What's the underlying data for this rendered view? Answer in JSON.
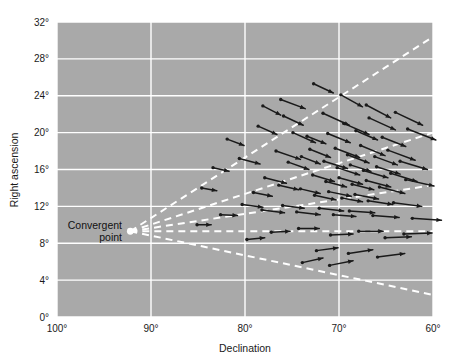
{
  "chart_data": {
    "type": "scatter",
    "title": "",
    "subtitle": "",
    "xlabel": "Declination",
    "ylabel": "Right ascension",
    "xlim": [
      100,
      60
    ],
    "ylim": [
      0,
      32
    ],
    "x_ticks": [
      100,
      90,
      80,
      70,
      60
    ],
    "x_tick_labels": [
      "100°",
      "90°",
      "80°",
      "70°",
      "60°"
    ],
    "y_ticks": [
      0,
      4,
      8,
      12,
      16,
      20,
      24,
      28,
      32
    ],
    "y_tick_labels": [
      "0°",
      "4°",
      "8°",
      "12°",
      "16°",
      "20°",
      "24°",
      "28°",
      "32°"
    ],
    "grid": true,
    "grid_color": "#ffffff",
    "plot_background": "#a9a9a9",
    "page_background": "#ffffff",
    "marker_color": "#1a1a1a",
    "ray_color": "#ffffff",
    "ray_style": "dashed",
    "annotations": [
      {
        "name": "convergent-point",
        "label_line1": "Convergent",
        "label_line2": "point",
        "x": 92.2,
        "y": 9.3,
        "marker": "dot",
        "marker_color": "#ffffff"
      }
    ],
    "rays": [
      {
        "name": "ray-upper-1",
        "from_x": 92.2,
        "from_y": 9.3,
        "to_x": 60.0,
        "to_y": 30.4
      },
      {
        "name": "ray-upper-2",
        "from_x": 92.2,
        "from_y": 9.3,
        "to_x": 60.0,
        "to_y": 20.0
      },
      {
        "name": "ray-middle",
        "from_x": 92.2,
        "from_y": 9.3,
        "to_x": 60.0,
        "to_y": 14.3
      },
      {
        "name": "ray-horizontal",
        "from_x": 92.2,
        "from_y": 9.3,
        "to_x": 60.0,
        "to_y": 9.3
      },
      {
        "name": "ray-lower",
        "from_x": 92.2,
        "from_y": 9.3,
        "to_x": 60.0,
        "to_y": 2.4
      }
    ],
    "series": [
      {
        "name": "proper motion vectors",
        "description": "Each point is a cluster star; the attached arrow is its proper-motion vector pointing back toward the convergent point.",
        "points": [
          {
            "x": 76.2,
            "y": 23.6,
            "dx": 2.6,
            "dy": 1.0
          },
          {
            "x": 72.7,
            "y": 25.3,
            "dx": 2.1,
            "dy": 1.0
          },
          {
            "x": 78.6,
            "y": 20.7,
            "dx": 2.0,
            "dy": 0.9
          },
          {
            "x": 71.7,
            "y": 22.1,
            "dx": 2.8,
            "dy": 1.3
          },
          {
            "x": 80.6,
            "y": 17.2,
            "dx": 2.2,
            "dy": 0.6
          },
          {
            "x": 76.7,
            "y": 18.0,
            "dx": 2.6,
            "dy": 0.9
          },
          {
            "x": 74.9,
            "y": 20.0,
            "dx": 2.4,
            "dy": 1.1
          },
          {
            "x": 73.4,
            "y": 19.6,
            "dx": 2.0,
            "dy": 0.8
          },
          {
            "x": 71.2,
            "y": 19.9,
            "dx": 2.4,
            "dy": 1.0
          },
          {
            "x": 69.5,
            "y": 21.0,
            "dx": 2.7,
            "dy": 1.2
          },
          {
            "x": 68.2,
            "y": 20.2,
            "dx": 2.3,
            "dy": 1.0
          },
          {
            "x": 66.8,
            "y": 21.6,
            "dx": 2.8,
            "dy": 1.3
          },
          {
            "x": 65.4,
            "y": 19.5,
            "dx": 2.5,
            "dy": 1.0
          },
          {
            "x": 70.4,
            "y": 18.3,
            "dx": 2.6,
            "dy": 1.0
          },
          {
            "x": 69.1,
            "y": 17.6,
            "dx": 2.3,
            "dy": 0.9
          },
          {
            "x": 67.7,
            "y": 18.6,
            "dx": 2.6,
            "dy": 1.1
          },
          {
            "x": 66.2,
            "y": 17.4,
            "dx": 2.4,
            "dy": 0.9
          },
          {
            "x": 64.8,
            "y": 18.1,
            "dx": 2.9,
            "dy": 1.1
          },
          {
            "x": 71.6,
            "y": 16.9,
            "dx": 2.5,
            "dy": 0.8
          },
          {
            "x": 70.2,
            "y": 16.2,
            "dx": 2.4,
            "dy": 0.8
          },
          {
            "x": 68.8,
            "y": 16.5,
            "dx": 2.2,
            "dy": 0.7
          },
          {
            "x": 67.4,
            "y": 15.9,
            "dx": 2.6,
            "dy": 0.8
          },
          {
            "x": 66.0,
            "y": 16.3,
            "dx": 2.5,
            "dy": 0.8
          },
          {
            "x": 64.5,
            "y": 15.6,
            "dx": 2.8,
            "dy": 0.9
          },
          {
            "x": 72.8,
            "y": 15.4,
            "dx": 2.3,
            "dy": 0.7
          },
          {
            "x": 71.4,
            "y": 14.7,
            "dx": 2.2,
            "dy": 0.6
          },
          {
            "x": 70.0,
            "y": 15.1,
            "dx": 2.5,
            "dy": 0.7
          },
          {
            "x": 68.6,
            "y": 14.4,
            "dx": 2.3,
            "dy": 0.6
          },
          {
            "x": 67.1,
            "y": 14.8,
            "dx": 2.6,
            "dy": 0.7
          },
          {
            "x": 65.7,
            "y": 14.1,
            "dx": 2.7,
            "dy": 0.7
          },
          {
            "x": 74.1,
            "y": 13.9,
            "dx": 2.1,
            "dy": 0.5
          },
          {
            "x": 72.6,
            "y": 13.2,
            "dx": 2.3,
            "dy": 0.5
          },
          {
            "x": 71.1,
            "y": 13.6,
            "dx": 2.4,
            "dy": 0.5
          },
          {
            "x": 69.7,
            "y": 12.9,
            "dx": 2.2,
            "dy": 0.4
          },
          {
            "x": 68.3,
            "y": 13.3,
            "dx": 2.5,
            "dy": 0.5
          },
          {
            "x": 66.9,
            "y": 12.6,
            "dx": 2.6,
            "dy": 0.4
          },
          {
            "x": 75.4,
            "y": 16.8,
            "dx": 2.2,
            "dy": 0.8
          },
          {
            "x": 74.0,
            "y": 17.4,
            "dx": 2.0,
            "dy": 0.8
          },
          {
            "x": 73.1,
            "y": 18.2,
            "dx": 2.2,
            "dy": 0.9
          },
          {
            "x": 77.9,
            "y": 15.1,
            "dx": 2.3,
            "dy": 0.6
          },
          {
            "x": 76.4,
            "y": 14.3,
            "dx": 2.1,
            "dy": 0.5
          },
          {
            "x": 79.1,
            "y": 13.5,
            "dx": 2.0,
            "dy": 0.4
          },
          {
            "x": 80.3,
            "y": 12.2,
            "dx": 2.2,
            "dy": 0.3
          },
          {
            "x": 78.2,
            "y": 11.6,
            "dx": 2.4,
            "dy": 0.3
          },
          {
            "x": 76.0,
            "y": 12.1,
            "dx": 2.3,
            "dy": 0.3
          },
          {
            "x": 74.5,
            "y": 11.4,
            "dx": 2.5,
            "dy": 0.3
          },
          {
            "x": 72.1,
            "y": 11.8,
            "dx": 2.6,
            "dy": 0.3
          },
          {
            "x": 70.6,
            "y": 11.1,
            "dx": 2.4,
            "dy": 0.2
          },
          {
            "x": 68.9,
            "y": 11.5,
            "dx": 2.7,
            "dy": 0.2
          },
          {
            "x": 66.4,
            "y": 11.0,
            "dx": 2.8,
            "dy": 0.2
          },
          {
            "x": 64.2,
            "y": 12.4,
            "dx": 3.0,
            "dy": 0.4
          },
          {
            "x": 62.9,
            "y": 14.9,
            "dx": 3.0,
            "dy": 0.7
          },
          {
            "x": 63.5,
            "y": 16.9,
            "dx": 2.9,
            "dy": 0.9
          },
          {
            "x": 62.2,
            "y": 10.7,
            "dx": 3.1,
            "dy": 0.2
          },
          {
            "x": 63.1,
            "y": 9.0,
            "dx": 3.0,
            "dy": -0.1
          },
          {
            "x": 65.1,
            "y": 8.6,
            "dx": 2.8,
            "dy": -0.1
          },
          {
            "x": 67.9,
            "y": 9.3,
            "dx": 2.6,
            "dy": 0.0
          },
          {
            "x": 70.9,
            "y": 8.9,
            "dx": 2.4,
            "dy": -0.1
          },
          {
            "x": 74.3,
            "y": 9.6,
            "dx": 2.2,
            "dy": 0.0
          },
          {
            "x": 77.2,
            "y": 9.2,
            "dx": 2.0,
            "dy": -0.1
          },
          {
            "x": 79.8,
            "y": 8.4,
            "dx": 1.9,
            "dy": -0.2
          },
          {
            "x": 72.4,
            "y": 7.2,
            "dx": 2.3,
            "dy": -0.3
          },
          {
            "x": 69.0,
            "y": 6.9,
            "dx": 2.6,
            "dy": -0.4
          },
          {
            "x": 65.9,
            "y": 6.5,
            "dx": 2.9,
            "dy": -0.4
          },
          {
            "x": 73.9,
            "y": 5.9,
            "dx": 2.2,
            "dy": -0.5
          },
          {
            "x": 71.0,
            "y": 5.6,
            "dx": 2.5,
            "dy": -0.5
          },
          {
            "x": 81.9,
            "y": 19.3,
            "dx": 1.8,
            "dy": 0.7
          },
          {
            "x": 83.4,
            "y": 16.2,
            "dx": 1.7,
            "dy": 0.4
          },
          {
            "x": 84.6,
            "y": 14.0,
            "dx": 1.6,
            "dy": 0.3
          },
          {
            "x": 82.6,
            "y": 11.1,
            "dx": 1.8,
            "dy": 0.1
          },
          {
            "x": 85.1,
            "y": 10.0,
            "dx": 1.5,
            "dy": 0.0
          },
          {
            "x": 69.8,
            "y": 24.1,
            "dx": 2.3,
            "dy": 1.3
          },
          {
            "x": 67.1,
            "y": 23.0,
            "dx": 2.6,
            "dy": 1.4
          },
          {
            "x": 64.0,
            "y": 22.2,
            "dx": 2.9,
            "dy": 1.4
          },
          {
            "x": 62.7,
            "y": 20.4,
            "dx": 3.0,
            "dy": 1.2
          },
          {
            "x": 75.9,
            "y": 21.8,
            "dx": 2.1,
            "dy": 1.0
          },
          {
            "x": 78.1,
            "y": 22.9,
            "dx": 1.9,
            "dy": 1.0
          }
        ]
      }
    ]
  },
  "axes": {
    "x_title": "Declination",
    "y_title": "Right ascension"
  }
}
